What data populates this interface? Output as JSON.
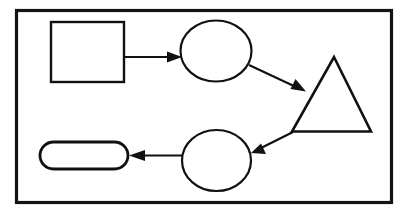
{
  "diagram": {
    "canvas": {
      "width": 411,
      "height": 216,
      "background": "#ffffff"
    },
    "frame": {
      "label": "diagram-frame",
      "x": 16.5,
      "y": 10.5,
      "width": 375,
      "height": 192,
      "stroke": "#141414",
      "stroke_width": 3.2
    },
    "style": {
      "shape_stroke": "#111111",
      "shape_fill": "#ffffff",
      "shape_stroke_width": 2.2,
      "connector_stroke": "#111111",
      "connector_stroke_width": 2.2
    },
    "nodes": [
      {
        "id": "node-square",
        "shape": "rectangle",
        "label": "",
        "x": 51,
        "y": 22,
        "width": 73,
        "height": 60,
        "stroke_width": 2.4
      },
      {
        "id": "node-ellipse-top",
        "shape": "ellipse",
        "label": "",
        "cx": 216,
        "cy": 51,
        "rx": 35.5,
        "ry": 30.5,
        "stroke_width": 2.2
      },
      {
        "id": "node-triangle",
        "shape": "triangle",
        "label": "",
        "points": "334,57 371,131.5 292,131.5",
        "stroke_width": 2.6
      },
      {
        "id": "node-ellipse-bottom",
        "shape": "ellipse",
        "label": "",
        "cx": 216.5,
        "cy": 160.5,
        "rx": 34.5,
        "ry": 30.5,
        "stroke_width": 2.2
      },
      {
        "id": "node-stadium",
        "shape": "stadium",
        "label": "",
        "x": 40,
        "y": 142,
        "width": 88,
        "height": 27,
        "radius": 13.5,
        "stroke_width": 2.8
      }
    ],
    "connectors": [
      {
        "id": "connector-square-to-ellipse-top",
        "from": "node-square",
        "to": "node-ellipse-top",
        "direction": "right",
        "line": "124,57 172,57",
        "head": "182,57 167,51.5 167,62.5"
      },
      {
        "id": "connector-ellipse-top-to-triangle",
        "from": "node-ellipse-top",
        "to": "node-triangle",
        "direction": "down-right",
        "line": "249,65 296,87",
        "head": "306,91.5 290.5,89 295.5,79"
      },
      {
        "id": "connector-triangle-to-ellipse-bottom",
        "from": "node-triangle",
        "to": "node-ellipse-bottom",
        "direction": "down-left",
        "line": "293,132 262,147.5",
        "head": "251,153 266,154 261,143.5"
      },
      {
        "id": "connector-ellipse-bottom-to-stadium",
        "from": "node-ellipse-bottom",
        "to": "node-stadium",
        "direction": "left",
        "line": "182,155.5 142,155.5",
        "head": "129,155.5 145,150 145,161"
      }
    ]
  }
}
